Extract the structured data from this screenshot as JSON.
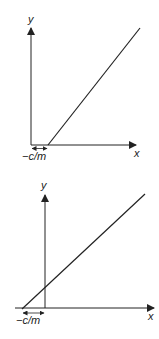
{
  "diagrams": [
    {
      "title": "Line y = m(x) + c with positive x-intercept",
      "x_axis_label": "x",
      "y_axis_label": "y",
      "intercept_label": "−c/m"
    },
    {
      "title": "Line y = m(x) + c with negative x-intercept",
      "x_axis_label": "x",
      "y_axis_label": "y",
      "intercept_label": "−c/m"
    }
  ],
  "colors": {
    "ink": "#222222",
    "background": "#ffffff"
  }
}
